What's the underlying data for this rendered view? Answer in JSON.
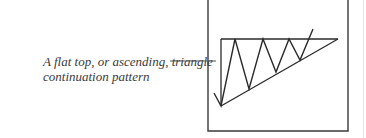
{
  "caption": {
    "line1": "A flat top, or ascending, triangle",
    "line2": "continuation pattern"
  },
  "figure": {
    "pattern": "ascending-triangle",
    "stroke_color": "#2a2a2a"
  }
}
